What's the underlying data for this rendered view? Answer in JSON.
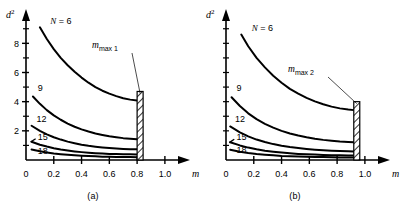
{
  "figure": {
    "panels": [
      {
        "caption": "(a)",
        "axes": {
          "ylabel": "d²",
          "ylabel_base": "d",
          "ylabel_exp": "2",
          "xlabel": "m",
          "xticks": [
            "0",
            "0.2",
            "0.4",
            "0.6",
            "0.8",
            "1.0"
          ],
          "xtick_values": [
            0,
            0.2,
            0.4,
            0.6,
            0.8,
            1.0
          ],
          "yticks": [
            "0",
            "2",
            "4",
            "6",
            "8"
          ],
          "ytick_values": [
            0,
            2,
            4,
            6,
            8
          ],
          "yticks_minor": [
            1,
            3,
            5,
            7,
            9
          ],
          "xlim": [
            0,
            1.08
          ],
          "ylim": [
            0,
            9.6
          ],
          "grid": false
        },
        "annotation": {
          "label_base": "m",
          "label_sub": "max 1",
          "label": "m_max 1",
          "x": 0.8,
          "leader": true
        },
        "barrier": {
          "name": "m_max 1",
          "x": 0.8,
          "width": 0.035,
          "top": 4.7,
          "hatch": "diagonal"
        },
        "curve_labels": [
          {
            "text": "N = 6",
            "series": "N=6"
          },
          {
            "text": "9",
            "series": "N=9"
          },
          {
            "text": "12",
            "series": "N=12"
          },
          {
            "text": "15",
            "series": "N=15"
          },
          {
            "text": "18",
            "series": "N=18"
          }
        ]
      },
      {
        "caption": "(b)",
        "axes": {
          "ylabel": "d²",
          "ylabel_base": "d",
          "ylabel_exp": "2",
          "xlabel": "m",
          "xticks": [
            "0",
            "0.2",
            "0.4",
            "0.6",
            "0.8",
            "1.0"
          ],
          "xtick_values": [
            0,
            0.2,
            0.4,
            0.6,
            0.8,
            1.0
          ],
          "yticks": [
            "0"
          ],
          "ytick_values": [
            0
          ],
          "yticks_minor": [
            1,
            2,
            3,
            4,
            5,
            6,
            7,
            8,
            9
          ],
          "xlim": [
            0,
            1.08
          ],
          "ylim": [
            0,
            9.6
          ],
          "grid": false
        },
        "annotation": {
          "label_base": "m",
          "label_sub": "max 2",
          "label": "m_max 2",
          "x": 0.92,
          "leader": true
        },
        "barrier": {
          "name": "m_max 2",
          "x": 0.92,
          "width": 0.035,
          "top": 4.0,
          "hatch": "diagonal"
        },
        "curve_labels": [
          {
            "text": "N = 6",
            "series": "N=6"
          },
          {
            "text": "9",
            "series": "N=9"
          },
          {
            "text": "12",
            "series": "N=12"
          },
          {
            "text": "15",
            "series": "N=15"
          },
          {
            "text": "18",
            "series": "N=18"
          }
        ]
      }
    ]
  },
  "chart_data": [
    {
      "type": "line",
      "title": "(a)",
      "xlabel": "m",
      "ylabel": "d²",
      "xlim": [
        0,
        1.08
      ],
      "ylim": [
        0,
        9.6
      ],
      "grid": false,
      "legend": "inline curve labels",
      "annotations": [
        {
          "text": "m_max 1",
          "x": 0.8,
          "type": "barrier-callout"
        }
      ],
      "series": [
        {
          "name": "N = 6",
          "x": [
            0.1,
            0.15,
            0.2,
            0.25,
            0.3,
            0.35,
            0.4,
            0.45,
            0.5,
            0.55,
            0.6,
            0.65,
            0.7,
            0.75,
            0.8
          ],
          "y": [
            9.1,
            8.3,
            7.6,
            7.0,
            6.5,
            6.05,
            5.65,
            5.3,
            5.0,
            4.75,
            4.55,
            4.38,
            4.24,
            4.14,
            4.08
          ]
        },
        {
          "name": "9",
          "x": [
            0.05,
            0.1,
            0.15,
            0.2,
            0.25,
            0.3,
            0.35,
            0.4,
            0.45,
            0.5,
            0.55,
            0.6,
            0.65,
            0.7,
            0.75,
            0.8
          ],
          "y": [
            4.35,
            3.85,
            3.42,
            3.06,
            2.76,
            2.5,
            2.28,
            2.1,
            1.95,
            1.82,
            1.72,
            1.63,
            1.56,
            1.5,
            1.46,
            1.43
          ]
        },
        {
          "name": "12",
          "x": [
            0.04,
            0.1,
            0.15,
            0.2,
            0.25,
            0.3,
            0.35,
            0.4,
            0.45,
            0.5,
            0.55,
            0.6,
            0.65,
            0.7,
            0.75,
            0.8
          ],
          "y": [
            2.35,
            2.0,
            1.76,
            1.56,
            1.4,
            1.26,
            1.15,
            1.05,
            0.97,
            0.91,
            0.86,
            0.82,
            0.79,
            0.76,
            0.74,
            0.73
          ]
        },
        {
          "name": "15",
          "x": [
            0.04,
            0.1,
            0.15,
            0.2,
            0.25,
            0.3,
            0.35,
            0.4,
            0.45,
            0.5,
            0.55,
            0.6,
            0.65,
            0.7,
            0.75,
            0.8
          ],
          "y": [
            1.25,
            1.05,
            0.92,
            0.81,
            0.72,
            0.65,
            0.59,
            0.54,
            0.5,
            0.47,
            0.44,
            0.42,
            0.41,
            0.4,
            0.39,
            0.38
          ]
        },
        {
          "name": "18",
          "x": [
            0.04,
            0.1,
            0.15,
            0.2,
            0.25,
            0.3,
            0.35,
            0.4,
            0.45,
            0.5,
            0.55,
            0.6,
            0.65,
            0.7,
            0.75,
            0.8
          ],
          "y": [
            0.72,
            0.6,
            0.52,
            0.45,
            0.4,
            0.36,
            0.32,
            0.29,
            0.27,
            0.25,
            0.23,
            0.22,
            0.21,
            0.2,
            0.2,
            0.19
          ]
        }
      ]
    },
    {
      "type": "line",
      "title": "(b)",
      "xlabel": "m",
      "ylabel": "d²",
      "xlim": [
        0,
        1.08
      ],
      "ylim": [
        0,
        9.6
      ],
      "grid": false,
      "legend": "inline curve labels",
      "annotations": [
        {
          "text": "m_max 2",
          "x": 0.92,
          "type": "barrier-callout"
        }
      ],
      "series": [
        {
          "name": "N = 6",
          "x": [
            0.11,
            0.16,
            0.22,
            0.28,
            0.34,
            0.4,
            0.46,
            0.52,
            0.58,
            0.64,
            0.7,
            0.76,
            0.82,
            0.88,
            0.92
          ],
          "y": [
            8.6,
            7.8,
            7.0,
            6.35,
            5.78,
            5.3,
            4.88,
            4.55,
            4.26,
            4.02,
            3.82,
            3.66,
            3.54,
            3.46,
            3.42
          ]
        },
        {
          "name": "9",
          "x": [
            0.04,
            0.1,
            0.16,
            0.22,
            0.28,
            0.34,
            0.4,
            0.46,
            0.52,
            0.58,
            0.64,
            0.7,
            0.76,
            0.82,
            0.88,
            0.92
          ],
          "y": [
            4.3,
            3.7,
            3.2,
            2.8,
            2.48,
            2.22,
            2.0,
            1.82,
            1.68,
            1.56,
            1.46,
            1.38,
            1.32,
            1.27,
            1.24,
            1.22
          ]
        },
        {
          "name": "12",
          "x": [
            0.03,
            0.1,
            0.16,
            0.22,
            0.28,
            0.34,
            0.4,
            0.46,
            0.52,
            0.58,
            0.64,
            0.7,
            0.76,
            0.82,
            0.88,
            0.92
          ],
          "y": [
            2.3,
            1.9,
            1.62,
            1.4,
            1.23,
            1.09,
            0.98,
            0.89,
            0.82,
            0.76,
            0.71,
            0.67,
            0.64,
            0.62,
            0.6,
            0.59
          ]
        },
        {
          "name": "15",
          "x": [
            0.03,
            0.1,
            0.16,
            0.22,
            0.28,
            0.34,
            0.4,
            0.46,
            0.52,
            0.58,
            0.64,
            0.7,
            0.76,
            0.82,
            0.88,
            0.92
          ],
          "y": [
            1.22,
            1.0,
            0.85,
            0.73,
            0.64,
            0.57,
            0.51,
            0.46,
            0.42,
            0.39,
            0.37,
            0.35,
            0.33,
            0.32,
            0.31,
            0.31
          ]
        },
        {
          "name": "18",
          "x": [
            0.03,
            0.1,
            0.16,
            0.22,
            0.28,
            0.34,
            0.4,
            0.46,
            0.52,
            0.58,
            0.64,
            0.7,
            0.76,
            0.82,
            0.88,
            0.92
          ],
          "y": [
            0.7,
            0.57,
            0.48,
            0.41,
            0.36,
            0.32,
            0.28,
            0.26,
            0.24,
            0.22,
            0.21,
            0.2,
            0.19,
            0.18,
            0.18,
            0.17
          ]
        }
      ]
    }
  ]
}
